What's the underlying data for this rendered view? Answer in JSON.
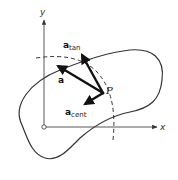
{
  "diagram": {
    "axes": {
      "x_label": "x",
      "y_label": "y"
    },
    "point_label": "P",
    "vectors": [
      {
        "name": "a",
        "symbol": "a",
        "subscript": ""
      },
      {
        "name": "a_tan",
        "symbol": "a",
        "subscript": "tan"
      },
      {
        "name": "a_cent",
        "symbol": "a",
        "subscript": "cent"
      }
    ],
    "colors": {
      "stroke": "#333333",
      "vector": "#111111",
      "background": "#ffffff"
    }
  }
}
